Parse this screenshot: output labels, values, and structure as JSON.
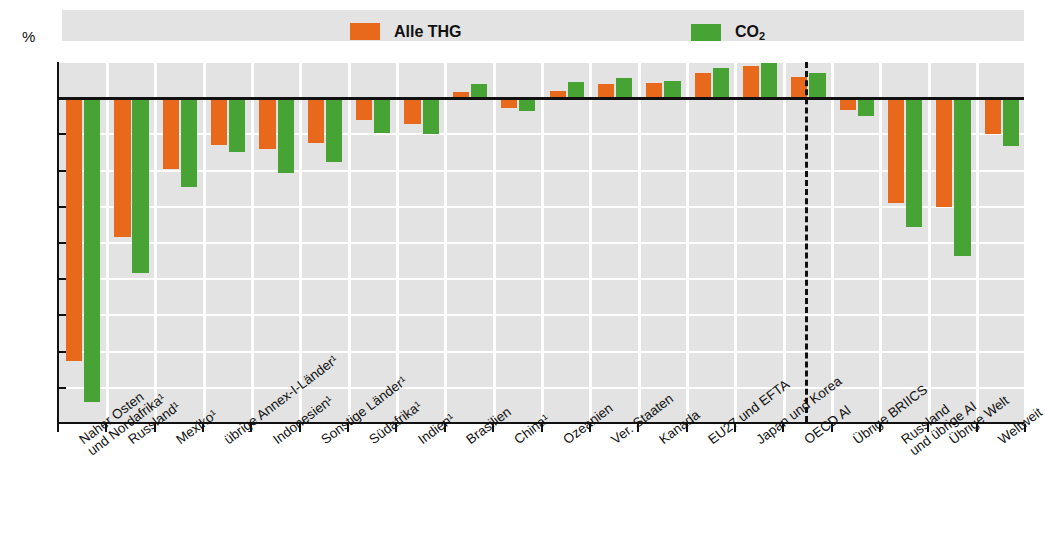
{
  "title_fragment": "",
  "axis": {
    "unit_label": "%",
    "y_ticks": [
      "5",
      "0",
      "-5",
      "-10",
      "-15",
      "-20",
      "-25",
      "-30",
      "-35",
      "-40",
      "-45"
    ],
    "y_min": -45,
    "y_max": 5
  },
  "legend": {
    "items": [
      {
        "name": "alle-thg",
        "label": "Alle THG",
        "color": "#e8691c",
        "sub": ""
      },
      {
        "name": "co2",
        "label": "CO",
        "color": "#47a334",
        "sub": "2"
      }
    ]
  },
  "separator": {
    "present": true,
    "note": "dashed vertical divider between countries and aggregates"
  },
  "chart_data": {
    "type": "bar",
    "title": "",
    "xlabel": "",
    "ylabel": "%",
    "ylim": [
      -45,
      5
    ],
    "yticks": [
      5,
      0,
      -5,
      -10,
      -15,
      -20,
      -25,
      -30,
      -35,
      -40,
      -45
    ],
    "grid": true,
    "legend_position": "top",
    "group_separator_after_index": 14,
    "categories": [
      "Naher Osten und Nordafrika¹",
      "Russland¹",
      "Mexiko¹",
      "übrige Annex-I-Länder¹",
      "Indonesien¹",
      "Sonstige Länder¹",
      "Südafrika¹",
      "Indien¹",
      "Brasilien",
      "China¹",
      "Ozeanien",
      "Ver. Staaten",
      "Kanada",
      "EU27 und EFTA",
      "Japan und Korea",
      "OECD Al",
      "Übrige BRIICS",
      "Russland und übrige AI",
      "Übrige Welt",
      "Weltweit"
    ],
    "categories_lines": [
      [
        "Naher Osten",
        "und Nordafrika¹"
      ],
      [
        "Russland¹"
      ],
      [
        "Mexiko¹"
      ],
      [
        "übrige Annex-I-Länder¹"
      ],
      [
        "Indonesien¹"
      ],
      [
        "Sonstige Länder¹"
      ],
      [
        "Südafrika¹"
      ],
      [
        "Indien¹"
      ],
      [
        "Brasilien"
      ],
      [
        "China¹"
      ],
      [
        "Ozeanien"
      ],
      [
        "Ver. Staaten"
      ],
      [
        "Kanada"
      ],
      [
        "EU27 und EFTA"
      ],
      [
        "Japan und Korea"
      ],
      [
        "OECD Al"
      ],
      [
        "Übrige BRIICS"
      ],
      [
        "Russland",
        "und übrige AI"
      ],
      [
        "Übrige Welt"
      ],
      [
        "Weltweit"
      ]
    ],
    "series": [
      {
        "name": "Alle THG",
        "color": "#e8691c",
        "values": [
          -36.3,
          -19.2,
          -9.8,
          -6.5,
          -7.0,
          -6.2,
          -3.0,
          -3.5,
          0.8,
          -1.3,
          1.0,
          1.9,
          2.1,
          3.5,
          4.4,
          2.9,
          -1.6,
          -14.5,
          -15.0,
          -4.9
        ]
      },
      {
        "name": "CO2",
        "color": "#47a334",
        "values": [
          -42.0,
          -24.2,
          -12.3,
          -7.5,
          -10.3,
          -8.8,
          -4.8,
          -5.0,
          1.9,
          -1.8,
          2.2,
          2.8,
          2.4,
          4.2,
          4.9,
          3.5,
          -2.4,
          -17.8,
          -21.8,
          -6.6
        ]
      }
    ]
  }
}
